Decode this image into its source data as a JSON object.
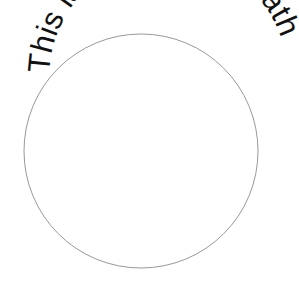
{
  "text_on_path": "This is text along a path",
  "colors": {
    "background": "#ffffff",
    "text": "#111111",
    "circle_stroke": "#999999"
  }
}
